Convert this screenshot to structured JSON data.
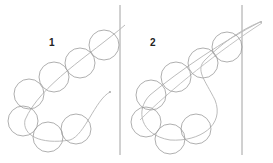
{
  "panels": [
    {
      "label": "1"
    },
    {
      "label": "2"
    }
  ],
  "colors": {
    "circle": "#9a9a9a",
    "path": "#b8b8b8",
    "divider": "#8a8a8a",
    "text": "#222222"
  }
}
